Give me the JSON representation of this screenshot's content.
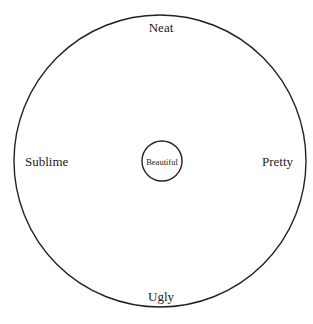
{
  "diagram": {
    "center_label": "Beautiful",
    "labels": {
      "top": "Neat",
      "left": "Sublime",
      "right": "Pretty",
      "bottom": "Ugly"
    },
    "stroke_color": "#222222",
    "background": "#ffffff"
  }
}
